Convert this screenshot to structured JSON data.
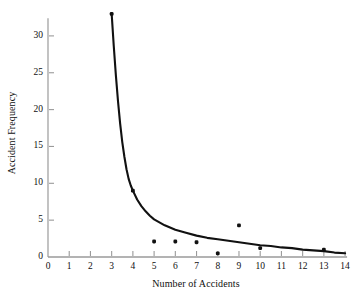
{
  "chart_data": {
    "type": "scatter",
    "title": "",
    "xlabel": "Number of Accidents",
    "ylabel": "Accident Frequency",
    "xlim": [
      0,
      14
    ],
    "ylim": [
      0,
      33
    ],
    "xticks": [
      0,
      1,
      2,
      3,
      4,
      5,
      6,
      7,
      8,
      9,
      10,
      11,
      12,
      13,
      14
    ],
    "xtick_labels": [
      "0",
      "1",
      "2",
      "3",
      "4",
      "5",
      "6",
      "7",
      "8",
      "9",
      "10",
      "11",
      "12",
      "13",
      "14"
    ],
    "yticks": [
      0,
      5,
      10,
      15,
      20,
      25,
      30
    ],
    "ytick_labels": [
      "0",
      "5",
      "10",
      "15",
      "20",
      "25",
      "30"
    ],
    "grid": false,
    "legend": null,
    "series": [
      {
        "name": "Observed accident frequency",
        "type": "scatter",
        "marker": "filled-square-dot",
        "color": "#111111",
        "points": [
          {
            "x": 3,
            "y": 33
          },
          {
            "x": 4,
            "y": 9
          },
          {
            "x": 5,
            "y": 2.1
          },
          {
            "x": 6,
            "y": 2.1
          },
          {
            "x": 7,
            "y": 2.0
          },
          {
            "x": 8,
            "y": 0.5
          },
          {
            "x": 9,
            "y": 4.3
          },
          {
            "x": 10,
            "y": 1.2
          },
          {
            "x": 13,
            "y": 1.0
          }
        ]
      },
      {
        "name": "Fitted decay curve",
        "type": "line",
        "color": "#111111",
        "points": [
          {
            "x": 3.0,
            "y": 33.0
          },
          {
            "x": 3.1,
            "y": 28.6
          },
          {
            "x": 3.2,
            "y": 24.6
          },
          {
            "x": 3.3,
            "y": 21.1
          },
          {
            "x": 3.4,
            "y": 18.1
          },
          {
            "x": 3.5,
            "y": 15.6
          },
          {
            "x": 3.6,
            "y": 13.6
          },
          {
            "x": 3.7,
            "y": 11.9
          },
          {
            "x": 3.8,
            "y": 10.6
          },
          {
            "x": 3.9,
            "y": 9.7
          },
          {
            "x": 4.0,
            "y": 9.0
          },
          {
            "x": 4.2,
            "y": 7.8
          },
          {
            "x": 4.4,
            "y": 6.9
          },
          {
            "x": 4.6,
            "y": 6.2
          },
          {
            "x": 4.8,
            "y": 5.6
          },
          {
            "x": 5.0,
            "y": 5.1
          },
          {
            "x": 5.5,
            "y": 4.3
          },
          {
            "x": 6.0,
            "y": 3.7
          },
          {
            "x": 6.5,
            "y": 3.3
          },
          {
            "x": 7.0,
            "y": 2.9
          },
          {
            "x": 7.5,
            "y": 2.6
          },
          {
            "x": 8.0,
            "y": 2.4
          },
          {
            "x": 8.5,
            "y": 2.2
          },
          {
            "x": 9.0,
            "y": 2.0
          },
          {
            "x": 9.5,
            "y": 1.8
          },
          {
            "x": 10.0,
            "y": 1.6
          },
          {
            "x": 10.5,
            "y": 1.5
          },
          {
            "x": 11.0,
            "y": 1.3
          },
          {
            "x": 11.5,
            "y": 1.2
          },
          {
            "x": 12.0,
            "y": 1.0
          },
          {
            "x": 12.5,
            "y": 0.9
          },
          {
            "x": 13.0,
            "y": 0.8
          },
          {
            "x": 13.5,
            "y": 0.6
          },
          {
            "x": 14.0,
            "y": 0.5
          }
        ]
      }
    ],
    "axis_color": "#9a9a9a",
    "text_color": "#0f0f0f",
    "background": "#ffffff"
  }
}
